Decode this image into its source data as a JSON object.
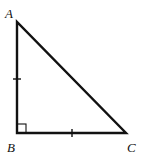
{
  "diagram": {
    "type": "right-triangle",
    "vertices": [
      {
        "label": "A",
        "x": 17,
        "y": 22,
        "label_x": 5,
        "label_y": 18
      },
      {
        "label": "B",
        "x": 17,
        "y": 133,
        "label_x": 7,
        "label_y": 152
      },
      {
        "label": "C",
        "x": 126,
        "y": 133,
        "label_x": 127,
        "label_y": 152
      }
    ],
    "right_angle_at": "B",
    "congruent_sides": [
      "AB",
      "BC"
    ],
    "stroke_color": "#111111",
    "background": "#ffffff"
  }
}
